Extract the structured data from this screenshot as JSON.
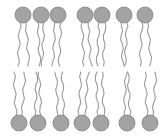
{
  "diagram": {
    "colors": {
      "head_fill": "#a3a3a3",
      "head_stroke": "#808080",
      "tail": "#9a9a9a",
      "background": "#ffffff"
    },
    "head_radius": 8,
    "top_layer": {
      "head_y": 15,
      "tail_end_y": 66,
      "head_x": [
        23,
        41,
        58,
        85,
        102,
        124,
        145
      ]
    },
    "bottom_layer": {
      "head_y": 123,
      "tail_end_y": 72,
      "head_x": [
        19,
        38,
        61,
        82,
        101,
        127,
        150
      ]
    }
  }
}
